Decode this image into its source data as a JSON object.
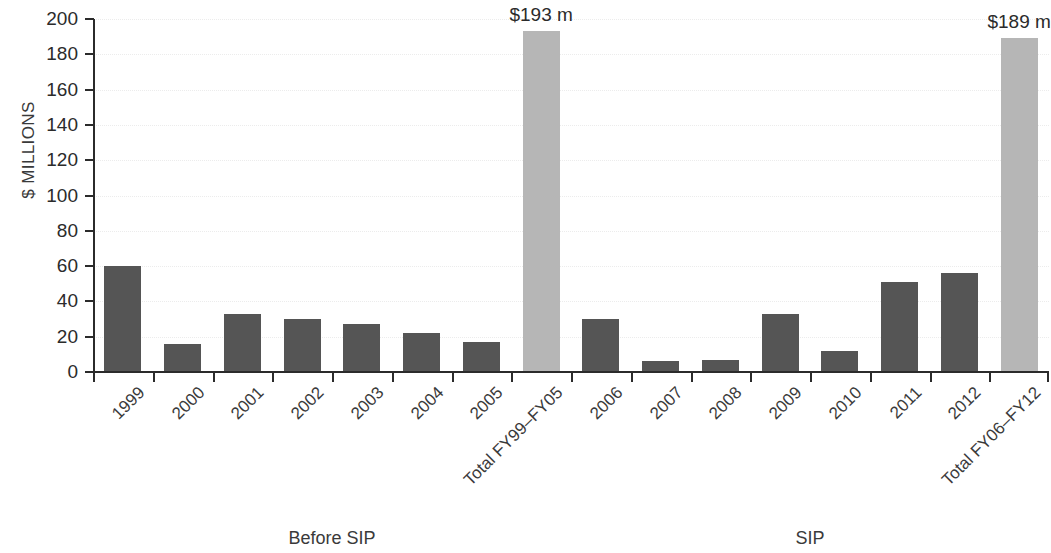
{
  "chart_data": {
    "type": "bar",
    "title": "",
    "subtitle": "",
    "xlabel": "",
    "ylabel": "$ MILLIONS",
    "ylim": [
      0,
      200
    ],
    "ytick_step": 20,
    "grid": true,
    "legend": false,
    "legend_position": "none",
    "categories": [
      "1999",
      "2000",
      "2001",
      "2002",
      "2003",
      "2004",
      "2005",
      "Total FY99–FY05",
      "2006",
      "2007",
      "2008",
      "2009",
      "2010",
      "2011",
      "2012",
      "Total FY06–FY12"
    ],
    "values": [
      60,
      16,
      33,
      30,
      27,
      22,
      17,
      193,
      30,
      6,
      7,
      33,
      12,
      51,
      56,
      189
    ],
    "bar_kinds": [
      "annual",
      "annual",
      "annual",
      "annual",
      "annual",
      "annual",
      "annual",
      "total",
      "annual",
      "annual",
      "annual",
      "annual",
      "annual",
      "annual",
      "annual",
      "total"
    ],
    "data_labels": [
      "",
      "",
      "",
      "",
      "",
      "",
      "",
      "$193 m",
      "",
      "",
      "",
      "",
      "",
      "",
      "",
      "$189 m"
    ],
    "ytick_labels": [
      "0",
      "20",
      "40",
      "60",
      "80",
      "100",
      "120",
      "140",
      "160",
      "180",
      "200"
    ],
    "group_captions": [
      {
        "label": "Before SIP",
        "span": [
          0,
          7
        ]
      },
      {
        "label": "SIP",
        "span": [
          8,
          15
        ]
      }
    ],
    "colors": {
      "annual_bar": "#555555",
      "total_bar": "#b6b6b6",
      "axis": "#2b2b2b",
      "gridline": "#ececec",
      "text": "#3a3a3a",
      "background": "#ffffff"
    }
  }
}
